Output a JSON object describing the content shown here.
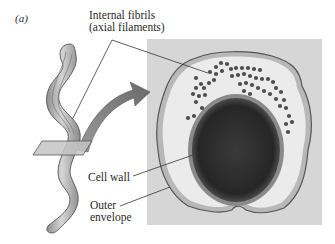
{
  "figure": {
    "panel_label": "(a)",
    "labels": {
      "fibrils_line1": "Internal fibrils",
      "fibrils_line2": "(axial filaments)",
      "cell_wall": "Cell wall",
      "outer_line1": "Outer",
      "outer_line2": "envelope"
    },
    "colors": {
      "micrograph_bg": "#d4d4d4",
      "cell_interior": "#ececec",
      "nucleoid": "#2b2b2b",
      "fibril_dot": "#4a4a4a",
      "bacterium_body": "#a9a9a9",
      "arrow": "#7d7d7d",
      "leader_line": "#333333"
    }
  }
}
